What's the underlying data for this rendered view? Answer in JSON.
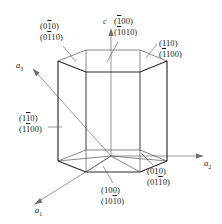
{
  "figure": {
    "type": "crystallography-diagram",
    "stroke_color": "#2b2b2b",
    "axis_color": "#8c8c8c",
    "text_color": "#1a1a1a",
    "background": "#ffffff"
  },
  "axes": [
    {
      "name": "a1",
      "label_base": "a",
      "label_sub": "1",
      "direction": "down-left"
    },
    {
      "name": "a2",
      "label_base": "a",
      "label_sub": "2",
      "direction": "right"
    },
    {
      "name": "a3",
      "label_base": "a",
      "label_sub": "3",
      "direction": "up-left"
    },
    {
      "name": "c",
      "label_base": "c",
      "label_sub": "",
      "direction": "up"
    }
  ],
  "plane_labels": [
    {
      "id": "upper-left-face",
      "miller": {
        "pre": "(0",
        "bar": "1",
        "post": "0)"
      },
      "miller_bravais": {
        "pre": "(0",
        "bar": "1",
        "post": "10)"
      }
    },
    {
      "id": "top-back-face",
      "miller": {
        "pre": "(",
        "bar": "1",
        "post": "00)"
      },
      "miller_bravais": {
        "pre": "(",
        "bar": "1",
        "post": "010)"
      }
    },
    {
      "id": "upper-right-face",
      "miller": {
        "pre": "(110)",
        "bar": "",
        "post": ""
      },
      "miller_bravais": {
        "pre": "(",
        "bar": "1",
        "post": "100)"
      }
    },
    {
      "id": "left-face",
      "miller": {
        "pre": "(1",
        "bar": "1",
        "post": "0)"
      },
      "miller_bravais": {
        "pre": "(1",
        "bar": "1",
        "post": "00)"
      }
    },
    {
      "id": "lower-right-face",
      "miller": {
        "pre": "(010)",
        "bar": "",
        "post": ""
      },
      "miller_bravais": {
        "pre": "(01",
        "bar": "1",
        "post": "0)"
      }
    },
    {
      "id": "front-face",
      "miller": {
        "pre": "(100)",
        "bar": "",
        "post": ""
      },
      "miller_bravais": {
        "pre": "(10",
        "bar": "1",
        "post": "0)"
      }
    }
  ]
}
